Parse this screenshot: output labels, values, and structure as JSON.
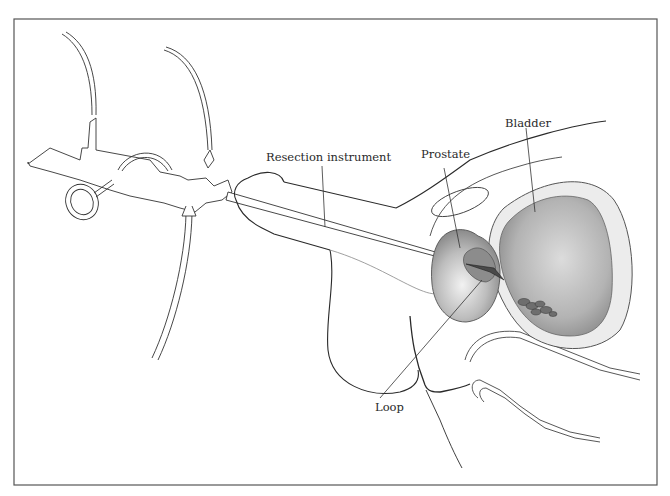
{
  "diagram": {
    "labels": {
      "resection_instrument": "Resection instrument",
      "prostate": "Prostate",
      "bladder": "Bladder",
      "loop": "Loop"
    },
    "colors": {
      "frame": "#555555",
      "line": "#2a2a2a",
      "bladder_fill": "#b8b8b8",
      "prostate_fill": "#a9a9a9",
      "bladder_wall": "#e6e6e6",
      "tissue_dark": "#6e6e6e"
    }
  }
}
